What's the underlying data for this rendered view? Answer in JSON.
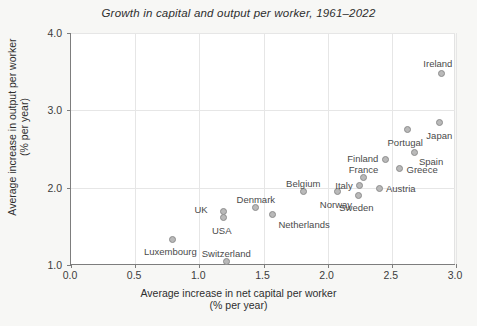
{
  "chart_data": {
    "type": "scatter",
    "title": "Growth in capital and output per worker, 1961–2022",
    "xlabel_line1": "Average increase in net capital per worker",
    "xlabel_line2": "(% per year)",
    "ylabel_line1": "Average increase in output per worker",
    "ylabel_line2": "(% per year)",
    "xlim": [
      0.0,
      3.0
    ],
    "ylim": [
      1.0,
      4.0
    ],
    "xticks": [
      0.0,
      0.5,
      1.0,
      1.5,
      2.0,
      2.5,
      3.0
    ],
    "xticklabels": [
      "0.0",
      "0.5",
      "1.0",
      "1.5",
      "2.0",
      "2.5",
      "3.0"
    ],
    "yticks": [
      1.0,
      2.0,
      3.0,
      4.0
    ],
    "yticklabels": [
      "1.0",
      "2.0",
      "3.0",
      "4.0"
    ],
    "grid": true,
    "legend": "none",
    "marker_color": "#b9b9b9",
    "marker_edge_color": "#8e8e8e",
    "gridline_color": "#e6e6e6",
    "axis_color": "#7d7d7d",
    "background_color": "#f7f7f5",
    "plot_background_color": "#ffffff",
    "points": [
      {
        "name": "Luxembourg",
        "x": 0.79,
        "y": 1.33,
        "label_dx": -2,
        "label_dy": 13,
        "align": "center"
      },
      {
        "name": "Switzerland",
        "x": 1.21,
        "y": 1.04,
        "label_dx": 0,
        "label_dy": -8,
        "align": "center"
      },
      {
        "name": "UK",
        "x": 1.19,
        "y": 1.69,
        "label_dx": -16,
        "label_dy": -2,
        "align": "right"
      },
      {
        "name": "USA",
        "x": 1.19,
        "y": 1.61,
        "label_dx": -2,
        "label_dy": 13,
        "align": "center"
      },
      {
        "name": "Denmark",
        "x": 1.44,
        "y": 1.74,
        "label_dx": 0,
        "label_dy": -8,
        "align": "center"
      },
      {
        "name": "Netherlands",
        "x": 1.57,
        "y": 1.65,
        "label_dx": 6,
        "label_dy": 10,
        "align": "left"
      },
      {
        "name": "Belgium",
        "x": 1.81,
        "y": 1.95,
        "label_dx": 0,
        "label_dy": -8,
        "align": "center"
      },
      {
        "name": "Norway",
        "x": 2.08,
        "y": 1.95,
        "label_dx": -2,
        "label_dy": 13,
        "align": "center"
      },
      {
        "name": "Sweden",
        "x": 2.24,
        "y": 1.9,
        "label_dx": -2,
        "label_dy": 13,
        "align": "center"
      },
      {
        "name": "Italy",
        "x": 2.25,
        "y": 2.03,
        "label_dx": -7,
        "label_dy": 1,
        "align": "right"
      },
      {
        "name": "France",
        "x": 2.28,
        "y": 2.13,
        "label_dx": 0,
        "label_dy": -8,
        "align": "center"
      },
      {
        "name": "Austria",
        "x": 2.4,
        "y": 1.99,
        "label_dx": 7,
        "label_dy": 1,
        "align": "left"
      },
      {
        "name": "Finland",
        "x": 2.45,
        "y": 2.36,
        "label_dx": -7,
        "label_dy": -1,
        "align": "right"
      },
      {
        "name": "Greece",
        "x": 2.56,
        "y": 2.25,
        "label_dx": 7,
        "label_dy": 2,
        "align": "left"
      },
      {
        "name": "Spain",
        "x": 2.68,
        "y": 2.46,
        "label_dx": 4,
        "label_dy": 10,
        "align": "left"
      },
      {
        "name": "Portugal",
        "x": 2.62,
        "y": 2.75,
        "label_dx": -2,
        "label_dy": 13,
        "align": "center"
      },
      {
        "name": "Japan",
        "x": 2.87,
        "y": 2.84,
        "label_dx": 0,
        "label_dy": 13,
        "align": "center"
      },
      {
        "name": "Ireland",
        "x": 2.89,
        "y": 3.48,
        "label_dx": -4,
        "label_dy": -9,
        "align": "center"
      }
    ]
  }
}
